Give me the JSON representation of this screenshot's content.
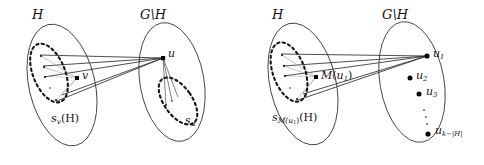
{
  "figure": {
    "type": "graph-theory-set-diagram",
    "background": "#ffffff",
    "stroke_color": "#3c3c3c",
    "vertex_color": "#0a0a0a",
    "width": 484,
    "height": 165,
    "panel_count": 2
  },
  "panels": [
    {
      "id": "left-panel",
      "name": "panel-v-u",
      "labels": {
        "set_left": "H",
        "set_right": "G\\H",
        "vertex_left": "v",
        "vertex_right": "u",
        "region_left_s": "s",
        "region_left_sub": "v",
        "region_left_arg": "(H)",
        "region_right_s": "s",
        "region_right_sub": "u"
      },
      "vertices": [
        {
          "name": "v",
          "x": 77,
          "y": 78
        },
        {
          "name": "u",
          "x": 163,
          "y": 58
        }
      ],
      "dashed_regions": [
        {
          "name": "s_v(H)",
          "cx": 49,
          "cy": 73,
          "rx": 16,
          "ry": 31,
          "rotate": -22
        },
        {
          "name": "s_u",
          "cx": 178,
          "cy": 101,
          "rx": 14,
          "ry": 27,
          "rotate": -35
        }
      ],
      "outer_sets": [
        {
          "name": "H",
          "cx": 62,
          "cy": 85,
          "rx": 33,
          "ry": 62,
          "rotate": -13
        },
        {
          "name": "G\\H",
          "cx": 172,
          "cy": 82,
          "rx": 32,
          "ry": 60,
          "rotate": -10
        }
      ]
    },
    {
      "id": "right-panel",
      "name": "panel-matching",
      "labels": {
        "set_left": "H",
        "set_right": "G\\H",
        "vertex_left_M": "M",
        "vertex_left_arg_open": "(",
        "vertex_left_sub": "u",
        "vertex_left_sub_idx": "1",
        "vertex_left_arg_close": ")",
        "region_left_s": "s",
        "region_left_sub_M": "M(u",
        "region_left_sub_idx": "1",
        "region_left_sub_close": ")",
        "region_left_arg": "(H)",
        "u1": "u",
        "u1_sub": "1",
        "u2": "u",
        "u2_sub": "2",
        "u3": "u",
        "u3_sub": "3",
        "uk": "u",
        "uk_sub": "k−|H|"
      },
      "vertices": [
        {
          "name": "M(u1)",
          "x": 316,
          "y": 77
        },
        {
          "name": "u1",
          "x": 427,
          "y": 56
        },
        {
          "name": "u2",
          "x": 410,
          "y": 78
        },
        {
          "name": "u3",
          "x": 419,
          "y": 94
        },
        {
          "name": "uk",
          "x": 428,
          "y": 134
        }
      ],
      "dots_ellipsis": [
        {
          "x": 424,
          "y": 110
        },
        {
          "x": 426,
          "y": 117
        },
        {
          "x": 427,
          "y": 124
        }
      ],
      "dashed_regions": [
        {
          "name": "s_M(u1)(H)",
          "cx": 289,
          "cy": 72,
          "rx": 16,
          "ry": 31,
          "rotate": -20
        }
      ],
      "outer_sets": [
        {
          "name": "H",
          "cx": 303,
          "cy": 84,
          "rx": 33,
          "ry": 62,
          "rotate": -13
        },
        {
          "name": "G\\H",
          "cx": 412,
          "cy": 82,
          "rx": 32,
          "ry": 61,
          "rotate": -10
        }
      ]
    }
  ]
}
